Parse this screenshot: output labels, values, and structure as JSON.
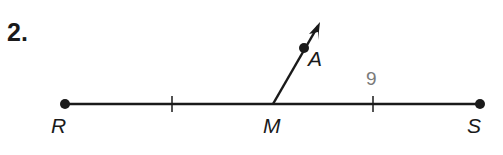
{
  "problem_number": "2.",
  "points": {
    "R": {
      "label": "R"
    },
    "M": {
      "label": "M"
    },
    "S": {
      "label": "S"
    },
    "A": {
      "label": "A"
    }
  },
  "measurement": {
    "label": "9",
    "segment": "MS"
  },
  "colors": {
    "line": "#1a1a1a",
    "measure": "#7a7a7a"
  }
}
